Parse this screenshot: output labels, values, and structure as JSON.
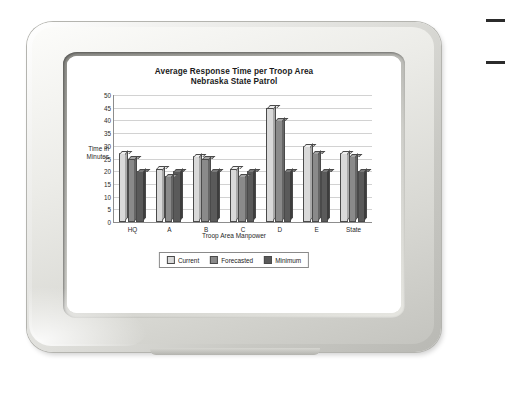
{
  "monitor": {
    "device_name": "crt-monitor",
    "bezel_color": "#dededa"
  },
  "corner_marks": {
    "top_dash": "",
    "bottom_dash": ""
  },
  "chart_data": {
    "type": "bar",
    "title_line1": "Average Response Time per Troop Area",
    "title_line2": "Nebraska State Patrol",
    "xlabel": "Troop Area Manpower",
    "ylabel_line1": "Time in",
    "ylabel_line2": "Minutes",
    "categories": [
      "HQ",
      "A",
      "B",
      "C",
      "D",
      "E",
      "State"
    ],
    "series": [
      {
        "name": "Current",
        "color": "#d9d9d9",
        "values": [
          27,
          21,
          26,
          21,
          45,
          30,
          27
        ]
      },
      {
        "name": "Forecasted",
        "color": "#8a8a8a",
        "values": [
          25,
          18,
          25,
          18,
          40,
          27,
          26
        ]
      },
      {
        "name": "Minimum",
        "color": "#5a5a5a",
        "values": [
          20,
          20,
          20,
          20,
          20,
          20,
          20
        ]
      }
    ],
    "ylim": [
      0,
      50
    ],
    "yticks": [
      0,
      5,
      10,
      15,
      20,
      25,
      30,
      35,
      40,
      45,
      50
    ],
    "grid": true,
    "legend_position": "bottom"
  }
}
